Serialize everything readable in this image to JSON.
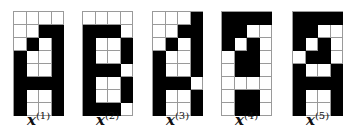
{
  "colors": {
    "on": "#000000",
    "off": "#ffffff",
    "gridline": "#9a9a9a"
  },
  "patterns": [
    {
      "label_var": "x",
      "label_sup": "(1)",
      "x": 13,
      "cells": [
        [
          0,
          0,
          0,
          0
        ],
        [
          0,
          0,
          1,
          1
        ],
        [
          0,
          1,
          0,
          1
        ],
        [
          1,
          0,
          0,
          1
        ],
        [
          1,
          0,
          0,
          1
        ],
        [
          1,
          1,
          1,
          1
        ],
        [
          1,
          0,
          0,
          1
        ],
        [
          1,
          0,
          0,
          1
        ]
      ]
    },
    {
      "label_var": "x",
      "label_sup": "(2)",
      "x": 82,
      "cells": [
        [
          0,
          0,
          0,
          0
        ],
        [
          1,
          1,
          1,
          0
        ],
        [
          1,
          0,
          0,
          1
        ],
        [
          1,
          0,
          0,
          1
        ],
        [
          1,
          1,
          1,
          0
        ],
        [
          1,
          0,
          0,
          1
        ],
        [
          1,
          0,
          0,
          1
        ],
        [
          1,
          1,
          1,
          0
        ]
      ]
    },
    {
      "label_var": "x",
      "label_sup": "(3)",
      "x": 152,
      "cells": [
        [
          0,
          0,
          0,
          1
        ],
        [
          0,
          0,
          1,
          1
        ],
        [
          0,
          1,
          0,
          1
        ],
        [
          1,
          0,
          0,
          1
        ],
        [
          1,
          0,
          0,
          1
        ],
        [
          1,
          1,
          1,
          0
        ],
        [
          1,
          0,
          0,
          1
        ],
        [
          1,
          0,
          0,
          1
        ]
      ]
    },
    {
      "label_var": "x",
      "label_sup": "(4)",
      "x": 221,
      "cells": [
        [
          1,
          1,
          1,
          1
        ],
        [
          1,
          1,
          0,
          0
        ],
        [
          1,
          0,
          1,
          0
        ],
        [
          0,
          1,
          1,
          0
        ],
        [
          0,
          1,
          1,
          0
        ],
        [
          0,
          0,
          0,
          0
        ],
        [
          0,
          1,
          1,
          0
        ],
        [
          0,
          1,
          1,
          0
        ]
      ]
    },
    {
      "label_var": "x",
      "label_sup": "(5)",
      "x": 292,
      "cells": [
        [
          1,
          1,
          1,
          1
        ],
        [
          1,
          1,
          0,
          0
        ],
        [
          1,
          0,
          1,
          0
        ],
        [
          0,
          1,
          1,
          0
        ],
        [
          1,
          0,
          0,
          1
        ],
        [
          1,
          1,
          1,
          1
        ],
        [
          1,
          0,
          0,
          1
        ],
        [
          1,
          0,
          0,
          1
        ]
      ]
    }
  ]
}
